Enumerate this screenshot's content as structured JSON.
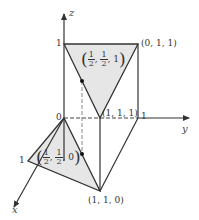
{
  "axes": {
    "x_label": "x",
    "y_label": "y",
    "z_label": "z",
    "origin_label": "0",
    "x_tick": "1",
    "y_tick": "1",
    "z_tick": "1"
  },
  "points": {
    "p011": "(0, 1, 1)",
    "p111": "(1, 1, 1)",
    "p110": "(1, 1, 0)"
  },
  "midpoints": {
    "top": {
      "num": "1",
      "den": "2",
      "last": "1"
    },
    "bottom": {
      "num": "1",
      "den": "2",
      "last": "0"
    }
  },
  "colors": {
    "line": "#333333",
    "fill": "#e6e6e6",
    "dashed": "#666666"
  }
}
